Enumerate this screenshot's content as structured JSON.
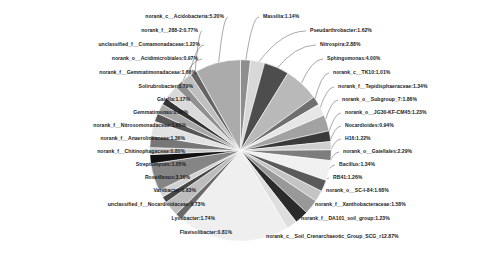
{
  "chart_data": {
    "type": "pie",
    "title": "",
    "legend_position": "outside-labels",
    "label_format": "name:percent",
    "palette": "grayscale",
    "categories": [
      "Massilia",
      "Pseudarthrobacter",
      "Nitrospira",
      "Sphingomonas",
      "norank_c__TK10",
      "norank_f__Tepidisphaeraceae",
      "norank_o__Subgroup_7",
      "norank_o__JG30-KF-CM45",
      "Nocardioides",
      "H16",
      "norank_o__Gaiellales",
      "Bacillus",
      "RB41",
      "norank_o__SC-I-84",
      "norank_f__Xanthobacteraceae",
      "norank_f__DA101_soil_group",
      "norank_c__Soil_Crenarchaeotic_Group_SCG_r",
      "Flavisolibacter",
      "Lysobacter",
      "unclassified_f__Nocardioidaceae",
      "Variibacter",
      "Roseiflexus",
      "Streptomyces",
      "norank_f__Chitinophagaceae",
      "norank_f__Anaerolineaceae",
      "norank_f__Nitrosomonadaceae",
      "Gemmatimonas",
      "Gaiella",
      "Solirubrobacter",
      "norank_f__Gemmatimonadaceae",
      "norank_o__Acidimicrobiales",
      "unclassified_f__Comamonadaceae",
      "norank_f__288-2",
      "norank_c__Acidobacteria"
    ],
    "values": [
      1.14,
      1.62,
      2.88,
      4.0,
      1.01,
      1.34,
      1.86,
      1.23,
      0.94,
      1.22,
      2.29,
      1.34,
      1.26,
      1.68,
      1.58,
      1.23,
      12.87,
      0.81,
      1.74,
      0.73,
      0.83,
      3.16,
      1.05,
      0.8,
      1.36,
      1.65,
      0.96,
      1.17,
      0.79,
      1.66,
      0.97,
      1.22,
      0.77,
      5.2
    ],
    "labels": [
      "Massilia:1.14%",
      "Pseudarthrobacter:1.62%",
      "Nitrospira:2.88%",
      "Sphingomonas:4.00%",
      "norank_c__TK10:1.01%",
      "norank_f__Tepidisphaeraceae:1.34%",
      "norank_o__Subgroup_7:1.86%",
      "norank_o__JG30-KF-CM45:1.23%",
      "Nocardioides:0.94%",
      "H16:1.22%",
      "norank_o__Gaiellales:2.29%",
      "Bacillus:1.34%",
      "RB41:1.26%",
      "norank_o__SC-I-84:1.68%",
      "norank_f__Xanthobacteraceae:1.58%",
      "norank_f__DA101_soil_group:1.23%",
      "norank_c__Soil_Crenarchaeotic_Group_SCG_r12.87%",
      "Flavisolibacter:0.81%",
      "Lysobacter:1.74%",
      "unclassified_f__Nocardioidaceae:0.73%",
      "Variibacter:0.83%",
      "Roseiflexus:3.16%",
      "Streptomyces:1.05%",
      "norank_f__Chitinophagaceae:0.80%",
      "norank_f__Anaerolineaceae:1.36%",
      "norank_f__Nitrosomonadaceae:1.65%",
      "Gemmatimonas:0.96%",
      "Gaiella:1.17%",
      "Solirubrobacter:0.79%",
      "norank_f__Gemmatimonadaceae:1.66%",
      "norank_o__Acidimicrobiales:0.97%",
      "unclassified_f__Comamonadaceae:1.22%",
      "norank_f__288-2:0.77%",
      "norank_c__Acidobacteria:5.20%"
    ]
  },
  "callouts": {
    "left": [
      {
        "text": "norank_c__Acidobacteria:5.20%",
        "x": 224,
        "y": 17,
        "idx": 33
      },
      {
        "text": "norank_f__288-2:0.77%",
        "x": 198,
        "y": 31,
        "idx": 32
      },
      {
        "text": "unclassified_f__Comamonadaceae:1.22%",
        "x": 200,
        "y": 45,
        "idx": 31
      },
      {
        "text": "norank_o__Acidimicrobiales:0.97%",
        "x": 198,
        "y": 59,
        "idx": 30
      },
      {
        "text": "norank_f__Gemmatimonadaceae:1.66%",
        "x": 196,
        "y": 73,
        "idx": 29
      },
      {
        "text": "Solirubrobacter:0.79%",
        "x": 193,
        "y": 87,
        "idx": 28
      },
      {
        "text": "Gaiella:1.17%",
        "x": 190,
        "y": 100,
        "idx": 27
      },
      {
        "text": "Gemmatimonas:0.96%",
        "x": 188,
        "y": 113,
        "idx": 26
      },
      {
        "text": "norank_f__Nitrosomonadaceae:1.65%",
        "x": 186,
        "y": 126,
        "idx": 25
      },
      {
        "text": "norank_f__Anaerolineaceae:1.36%",
        "x": 185,
        "y": 139,
        "idx": 24
      },
      {
        "text": "norank_f__Chitinophagaceae:0.80%",
        "x": 185,
        "y": 152,
        "idx": 23
      },
      {
        "text": "Streptomyces:1.05%",
        "x": 186,
        "y": 165,
        "idx": 22
      },
      {
        "text": "Roseiflexus:3.16%",
        "x": 190,
        "y": 178,
        "idx": 21
      },
      {
        "text": "Variibacter:0.83%",
        "x": 196,
        "y": 191,
        "idx": 20
      },
      {
        "text": "unclassified_f__Nocardioidaceae:0.73%",
        "x": 205,
        "y": 205,
        "idx": 19
      },
      {
        "text": "Lysobacter:1.74%",
        "x": 215,
        "y": 219,
        "idx": 18
      },
      {
        "text": "Flavisolibacter:0.81%",
        "x": 232,
        "y": 233,
        "idx": 17
      }
    ],
    "right": [
      {
        "text": "Massilia:1.14%",
        "x": 263,
        "y": 17,
        "idx": 0
      },
      {
        "text": "Pseudarthrobacter:1.62%",
        "x": 310,
        "y": 31,
        "idx": 1
      },
      {
        "text": "Nitrospira:2.88%",
        "x": 320,
        "y": 45,
        "idx": 2
      },
      {
        "text": "Sphingomonas:4.00%",
        "x": 327,
        "y": 59,
        "idx": 3
      },
      {
        "text": "norank_c__TK10:1.01%",
        "x": 333,
        "y": 73,
        "idx": 4
      },
      {
        "text": "norank_f__Tepidisphaeraceae:1.34%",
        "x": 338,
        "y": 87,
        "idx": 5
      },
      {
        "text": "norank_o__Subgroup_7:1.86%",
        "x": 342,
        "y": 100,
        "idx": 6
      },
      {
        "text": "norank_o__JG30-KF-CM45:1.23%",
        "x": 345,
        "y": 113,
        "idx": 7
      },
      {
        "text": "Nocardioides:0.94%",
        "x": 345,
        "y": 126,
        "idx": 8
      },
      {
        "text": "H16:1.22%",
        "x": 345,
        "y": 139,
        "idx": 9
      },
      {
        "text": "norank_o__Gaiellales:2.29%",
        "x": 343,
        "y": 152,
        "idx": 10
      },
      {
        "text": "Bacillus:1.34%",
        "x": 339,
        "y": 165,
        "idx": 11
      },
      {
        "text": "RB41:1.26%",
        "x": 333,
        "y": 178,
        "idx": 12
      },
      {
        "text": "norank_o__SC-I-84:1.68%",
        "x": 326,
        "y": 191,
        "idx": 13
      },
      {
        "text": "norank_f__Xanthobacteraceae:1.58%",
        "x": 315,
        "y": 205,
        "idx": 14
      },
      {
        "text": "norank_f__DA101_soil_group:1.23%",
        "x": 301,
        "y": 219,
        "idx": 15
      },
      {
        "text": "norank_c__Soil_Crenarchaeotic_Group_SCG_r12.87%",
        "x": 266,
        "y": 237,
        "idx": 16
      }
    ]
  },
  "colors": {
    "background": "#ffffff",
    "text": "#1a1a1a",
    "leader_line": "#555555",
    "slice_edge": "#ffffff"
  }
}
